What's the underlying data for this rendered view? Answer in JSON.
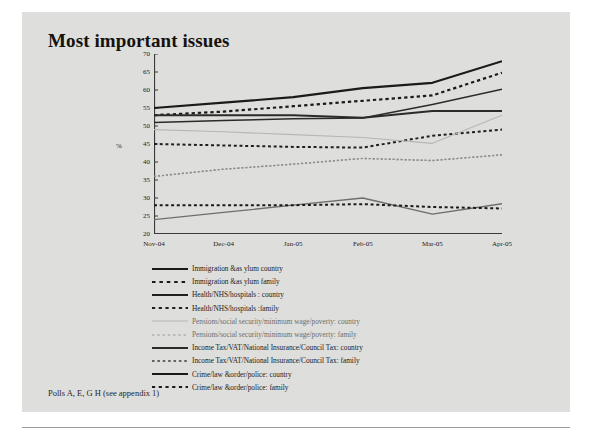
{
  "slide": {
    "title": "Most important issues",
    "footer": "Polls A, E, G H (see appendix 1)"
  },
  "chart_data": {
    "type": "line",
    "title": "Most important issues",
    "xlabel": "",
    "ylabel": "%",
    "ylim": [
      20,
      70
    ],
    "ytick_step": 5,
    "grid": false,
    "legend_position": "below",
    "categories": [
      "Nov-04",
      "Dec-04",
      "Jan-05",
      "Feb-05",
      "Mar-05",
      "Apr-05"
    ],
    "yticks": [
      "20",
      "25",
      "30",
      "35",
      "40",
      "45",
      "50",
      "55",
      "60",
      "65",
      "70"
    ],
    "series": [
      {
        "name": "Immigration & asylum country",
        "style": "solid",
        "color": "#1a1a1a",
        "width": 2.2,
        "values": [
          55,
          56.5,
          58,
          60.5,
          62,
          68
        ]
      },
      {
        "name": "Immigration & asylum family",
        "style": "dashed",
        "color": "#1a1a1a",
        "width": 2.2,
        "values": [
          53,
          54,
          55.5,
          57,
          58.5,
          64.8
        ]
      },
      {
        "name": "Health/NHS/hospitals : country",
        "style": "solid",
        "color": "#2b2b2b",
        "width": 2.0,
        "values": [
          53,
          53,
          53,
          52.3,
          54.2,
          54.2
        ]
      },
      {
        "name": "Health/NHS/hospitals :family",
        "style": "dashed",
        "color": "#1f1f1f",
        "width": 2.0,
        "values": [
          45,
          44.6,
          44.2,
          44,
          47.3,
          49
        ]
      },
      {
        "name": "Pensions/social security/minimum wage/poverty: country",
        "style": "solid",
        "color": "#b6b6b4",
        "width": 1.2,
        "values": [
          49,
          48.4,
          47.6,
          46.8,
          45.2,
          53
        ]
      },
      {
        "name": "Pensions/social security/minimum wage/poverty: family",
        "style": "dashed",
        "color": "#a8a8a6",
        "width": 1.4,
        "values": [
          36,
          38,
          39.4,
          41,
          40.4,
          42
        ]
      },
      {
        "name": "Income Tax/VAT/National Insurance/Council Tax: country",
        "style": "solid",
        "color": "#2b2b2b",
        "width": 1.5,
        "values": [
          51,
          51.5,
          52,
          52.2,
          56,
          60.2
        ]
      },
      {
        "name": "Income Tax/VAT/National Insurance/Council Tax: family",
        "style": "dashed",
        "color": "#8c8c8a",
        "width": 1.4,
        "values": [
          36,
          38,
          39.4,
          41,
          40.4,
          42
        ]
      },
      {
        "name": "Crime/law & order/police: country",
        "style": "solid",
        "color": "#6e6e6c",
        "width": 1.3,
        "values": [
          24,
          26,
          28,
          30,
          25.5,
          28.4
        ]
      },
      {
        "name": "Crime/law & order/police: family",
        "style": "dashed",
        "color": "#1a1a1a",
        "width": 2.0,
        "values": [
          28,
          28,
          28,
          28.3,
          27.5,
          27.1
        ]
      }
    ]
  },
  "legend": {
    "items": [
      {
        "label": "Immigration &as ylum country",
        "style": "solid",
        "color": "#1a1a1a",
        "width": 2.2,
        "muted": false
      },
      {
        "label": "Immigration &as ylum family",
        "style": "dashed",
        "color": "#1a1a1a",
        "width": 2.2,
        "muted": false
      },
      {
        "label": "Health/NHS/hospitals : country",
        "style": "solid",
        "color": "#1f1f1f",
        "width": 2.2,
        "muted": false
      },
      {
        "label": "Health/NHS/hospitals :family",
        "style": "dashed",
        "color": "#1f1f1f",
        "width": 2.0,
        "muted": false
      },
      {
        "label": "Pensions/social security/minimum wage/poverty: country",
        "style": "solid",
        "color": "#b6b6b4",
        "width": 1.2,
        "muted": true
      },
      {
        "label": "Pensions/social security/minimum wage/poverty: family",
        "style": "dashed",
        "color": "#b0b0ae",
        "width": 1.3,
        "muted": true
      },
      {
        "label": "Income Tax/VAT/National Insurance/Council Tax: country",
        "style": "solid",
        "color": "#2b2b2b",
        "width": 1.8,
        "muted": false
      },
      {
        "label": "Income Tax/VAT/National Insurance/Council Tax: family",
        "style": "dashed",
        "color": "#3a3a38",
        "width": 1.6,
        "muted": false
      },
      {
        "label": "Crime/law &order/police: country",
        "style": "solid",
        "color": "#1a1a1a",
        "width": 2.2,
        "muted": false
      },
      {
        "label": "Crime/law &order/police: family",
        "style": "dashed",
        "color": "#1a1a1a",
        "width": 2.0,
        "muted": false
      }
    ]
  }
}
